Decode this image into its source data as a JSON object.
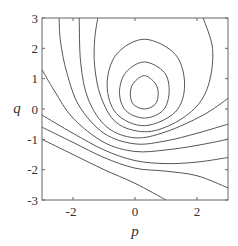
{
  "chart_data": {
    "type": "contour",
    "title": "",
    "xlabel": "p",
    "ylabel": "q",
    "xlim": [
      -3,
      3
    ],
    "ylim": [
      -3,
      3
    ],
    "grid": false,
    "legend": null,
    "x_ticks": [
      -2,
      0,
      2
    ],
    "y_ticks": [
      -3,
      -2,
      -1,
      0,
      1,
      2,
      3
    ],
    "x_tick_labels": [
      "-2",
      "0",
      "2"
    ],
    "y_tick_labels": [
      "-3",
      "-2",
      "-1",
      "0",
      "1",
      "2",
      "3"
    ],
    "center_of_closed_contours": {
      "p": 0.3,
      "q": 0.5
    },
    "contour_count": 12,
    "contours": [
      {
        "id": 1,
        "closed": true,
        "points": [
          [
            0.3,
            1.1
          ],
          [
            0.65,
            0.85
          ],
          [
            0.75,
            0.5
          ],
          [
            0.65,
            0.15
          ],
          [
            0.3,
            0.0
          ],
          [
            -0.05,
            0.15
          ],
          [
            -0.15,
            0.5
          ],
          [
            -0.05,
            0.85
          ]
        ]
      },
      {
        "id": 2,
        "closed": true,
        "points": [
          [
            0.3,
            1.55
          ],
          [
            0.95,
            1.2
          ],
          [
            1.1,
            0.55
          ],
          [
            0.9,
            -0.05
          ],
          [
            0.3,
            -0.3
          ],
          [
            -0.3,
            -0.05
          ],
          [
            -0.5,
            0.55
          ],
          [
            -0.3,
            1.2
          ]
        ]
      },
      {
        "id": 3,
        "closed": true,
        "points": [
          [
            0.3,
            2.3
          ],
          [
            1.3,
            1.8
          ],
          [
            1.6,
            0.8
          ],
          [
            1.3,
            -0.1
          ],
          [
            0.3,
            -0.55
          ],
          [
            -0.6,
            -0.15
          ],
          [
            -0.9,
            0.8
          ],
          [
            -0.6,
            1.8
          ]
        ]
      },
      {
        "id": 4,
        "closed": false,
        "points": [
          [
            2.2,
            3.0
          ],
          [
            2.5,
            2.0
          ],
          [
            2.4,
            0.9
          ],
          [
            2.0,
            0.1
          ],
          [
            1.2,
            -0.5
          ],
          [
            0.3,
            -0.75
          ],
          [
            -0.6,
            -0.45
          ],
          [
            -1.1,
            0.4
          ],
          [
            -1.3,
            1.4
          ],
          [
            -1.3,
            2.3
          ],
          [
            -1.2,
            3.0
          ]
        ]
      },
      {
        "id": 5,
        "closed": false,
        "points": [
          [
            3.0,
            0.35
          ],
          [
            2.2,
            -0.2
          ],
          [
            1.0,
            -0.75
          ],
          [
            0.0,
            -0.95
          ],
          [
            -0.9,
            -0.6
          ],
          [
            -1.5,
            0.3
          ],
          [
            -1.75,
            1.5
          ],
          [
            -1.8,
            3.0
          ]
        ]
      },
      {
        "id": 6,
        "closed": false,
        "points": [
          [
            3.0,
            -0.5
          ],
          [
            2.0,
            -0.8
          ],
          [
            1.0,
            -1.05
          ],
          [
            0.0,
            -1.15
          ],
          [
            -1.0,
            -0.8
          ],
          [
            -1.8,
            0.1
          ],
          [
            -2.2,
            1.2
          ],
          [
            -2.4,
            2.2
          ],
          [
            -2.45,
            3.0
          ]
        ]
      },
      {
        "id": 7,
        "closed": false,
        "points": [
          [
            3.0,
            -1.0
          ],
          [
            2.0,
            -1.2
          ],
          [
            1.0,
            -1.35
          ],
          [
            0.0,
            -1.4
          ],
          [
            -1.0,
            -1.1
          ],
          [
            -2.0,
            -0.3
          ],
          [
            -2.6,
            0.6
          ],
          [
            -3.0,
            1.3
          ]
        ]
      },
      {
        "id": 8,
        "closed": false,
        "points": [
          [
            3.0,
            -1.6
          ],
          [
            2.0,
            -1.75
          ],
          [
            1.0,
            -1.8
          ],
          [
            0.0,
            -1.7
          ],
          [
            -1.0,
            -1.35
          ],
          [
            -2.0,
            -0.8
          ],
          [
            -3.0,
            -0.2
          ]
        ]
      },
      {
        "id": 9,
        "closed": false,
        "points": [
          [
            3.0,
            -2.6
          ],
          [
            2.0,
            -2.2
          ],
          [
            1.0,
            -2.05
          ],
          [
            0.0,
            -1.95
          ],
          [
            -1.0,
            -1.6
          ],
          [
            -2.0,
            -1.1
          ],
          [
            -3.0,
            -0.6
          ]
        ]
      },
      {
        "id": 10,
        "closed": false,
        "points": [
          [
            1.0,
            -3.0
          ],
          [
            0.0,
            -2.45
          ],
          [
            -1.0,
            -2.0
          ],
          [
            -2.0,
            -1.5
          ],
          [
            -3.0,
            -1.0
          ]
        ]
      }
    ]
  },
  "axes": {
    "x_label": "p",
    "y_label": "q",
    "x_tick_labels": [
      "-2",
      "0",
      "2"
    ],
    "y_tick_labels": [
      "3",
      "2",
      "1",
      "0",
      "-1",
      "-2",
      "-3"
    ]
  }
}
